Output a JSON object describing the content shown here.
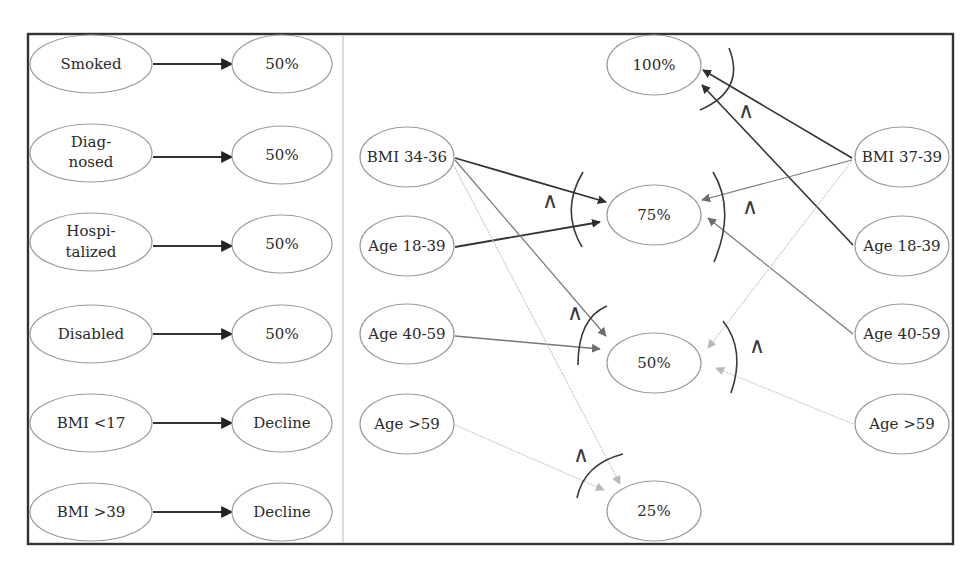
{
  "diagram": {
    "left_panel": {
      "rules": [
        {
          "condition": "Smoked",
          "outcome": "50%"
        },
        {
          "condition": "Diag-\nnosed",
          "condition_lines": [
            "Diag-",
            "nosed"
          ],
          "outcome": "50%"
        },
        {
          "condition": "Hospi-\ntalized",
          "condition_lines": [
            "Hospi-",
            "talized"
          ],
          "outcome": "50%"
        },
        {
          "condition": "Disabled",
          "outcome": "50%"
        },
        {
          "condition": "BMI <17",
          "outcome": "Decline"
        },
        {
          "condition": "BMI >39",
          "outcome": "Decline"
        }
      ]
    },
    "right_panel": {
      "outcomes": [
        "100%",
        "75%",
        "50%",
        "25%"
      ],
      "left_inputs": [
        "BMI 34-36",
        "Age 18-39",
        "Age 40-59",
        "Age >59"
      ],
      "right_inputs": [
        "BMI 37-39",
        "Age 18-39",
        "Age 40-59",
        "Age >59"
      ],
      "and_symbol": "∧",
      "edges": [
        {
          "from": "BMI 34-36 (left)",
          "to": "75%",
          "shade": "dark"
        },
        {
          "from": "Age 18-39 (left)",
          "to": "75%",
          "shade": "dark"
        },
        {
          "from": "BMI 34-36 (left)",
          "to": "50%",
          "shade": "medium"
        },
        {
          "from": "Age 40-59 (left)",
          "to": "50%",
          "shade": "medium"
        },
        {
          "from": "BMI 34-36 (left)",
          "to": "25%",
          "shade": "light"
        },
        {
          "from": "Age >59 (left)",
          "to": "25%",
          "shade": "light"
        },
        {
          "from": "BMI 37-39 (right)",
          "to": "100%",
          "shade": "dark"
        },
        {
          "from": "Age 18-39 (right)",
          "to": "100%",
          "shade": "dark"
        },
        {
          "from": "BMI 37-39 (right)",
          "to": "75%",
          "shade": "medium"
        },
        {
          "from": "Age 40-59 (right)",
          "to": "75%",
          "shade": "medium"
        },
        {
          "from": "BMI 37-39 (right)",
          "to": "50%",
          "shade": "light"
        },
        {
          "from": "Age >59 (right)",
          "to": "50%",
          "shade": "light"
        }
      ]
    },
    "colors": {
      "dark": "#333333",
      "medium": "#7a7a7a",
      "light": "#c2c2c2",
      "frame": "#333333",
      "node_border": "#9a9a9a"
    }
  }
}
